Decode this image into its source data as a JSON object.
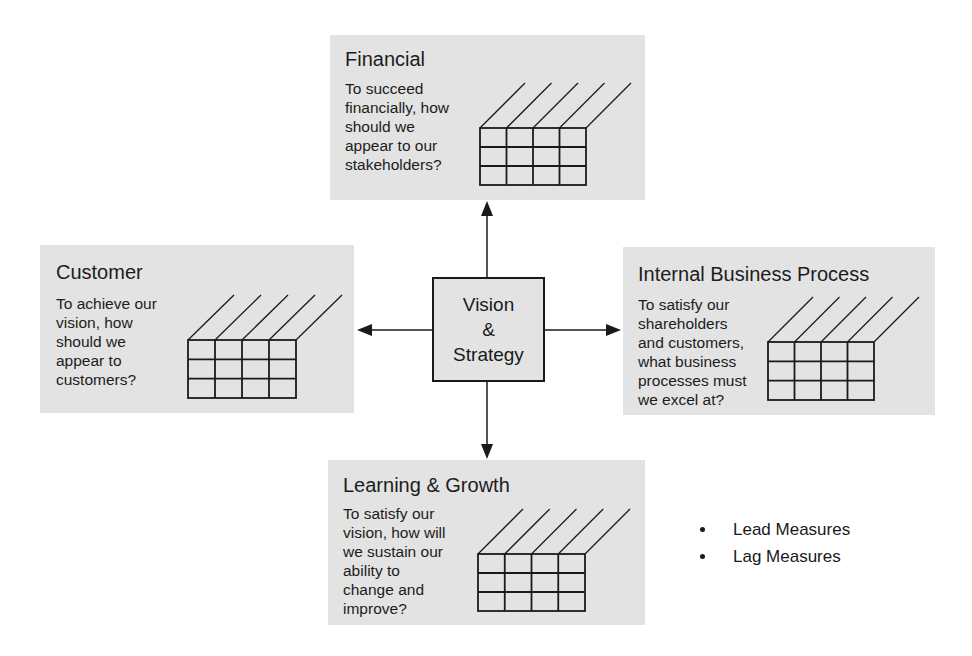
{
  "center": {
    "lines": [
      "Vision",
      "&",
      "Strategy"
    ]
  },
  "perspectives": {
    "financial": {
      "title": "Financial",
      "question_lines": [
        "To succeed",
        "financially, how",
        "should we",
        "appear to our",
        "stakeholders?"
      ]
    },
    "customer": {
      "title": "Customer",
      "question_lines": [
        "To achieve our",
        "vision, how",
        "should we",
        "appear to",
        "customers?"
      ]
    },
    "internal": {
      "title": "Internal Business Process",
      "question_lines": [
        "To satisfy our",
        "shareholders",
        "and customers,",
        "what business",
        "processes must",
        "we excel at?"
      ]
    },
    "learning": {
      "title": "Learning & Growth",
      "question_lines": [
        "To satisfy our",
        "vision, how will",
        "we sustain our",
        "ability to",
        "change and",
        "improve?"
      ]
    }
  },
  "legend": {
    "items": [
      "Lead Measures",
      "Lag Measures"
    ]
  },
  "colors": {
    "panel_fill": "#e3e3e3",
    "line": "#1a1a1a"
  }
}
